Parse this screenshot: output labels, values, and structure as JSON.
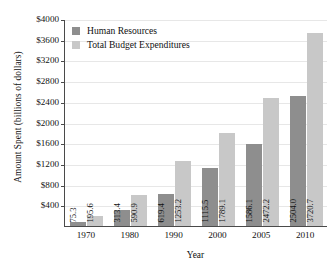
{
  "chart_data": {
    "type": "bar",
    "title": "",
    "xlabel": "Year",
    "ylabel": "Amount Spent (billions of dollars)",
    "categories": [
      "1970",
      "1980",
      "1990",
      "2000",
      "2005",
      "2010"
    ],
    "series": [
      {
        "name": "Human Resources",
        "color": "#8e8e8e",
        "values": [
          75.3,
          313.4,
          619.4,
          1115.5,
          1586.1,
          2504.0
        ],
        "labels": [
          "75.3",
          "313.4",
          "619.4",
          "1115.5",
          "1586.1",
          "2504.0"
        ]
      },
      {
        "name": "Total Budget Expenditures",
        "color": "#c8c8c8",
        "values": [
          195.6,
          590.9,
          1253.2,
          1789.1,
          2472.2,
          3720.7
        ],
        "labels": [
          "195.6",
          "590.9",
          "1253.2",
          "1789.1",
          "2472.2",
          "3720.7"
        ]
      }
    ],
    "ylim": [
      0,
      4000
    ],
    "yticks": [
      400,
      800,
      1200,
      1600,
      2000,
      2400,
      2800,
      3200,
      3600,
      4000
    ],
    "ytick_labels": [
      "$400",
      "$800",
      "$1200",
      "$1600",
      "$2000",
      "$2400",
      "$2800",
      "$3200",
      "$3600",
      "$4000"
    ],
    "grid": true,
    "legend_position": "top-left"
  },
  "legend": {
    "items": [
      {
        "label": "Human Resources",
        "swatch": "hr"
      },
      {
        "label": "Total Budget Expenditures",
        "swatch": "tbe"
      }
    ]
  }
}
